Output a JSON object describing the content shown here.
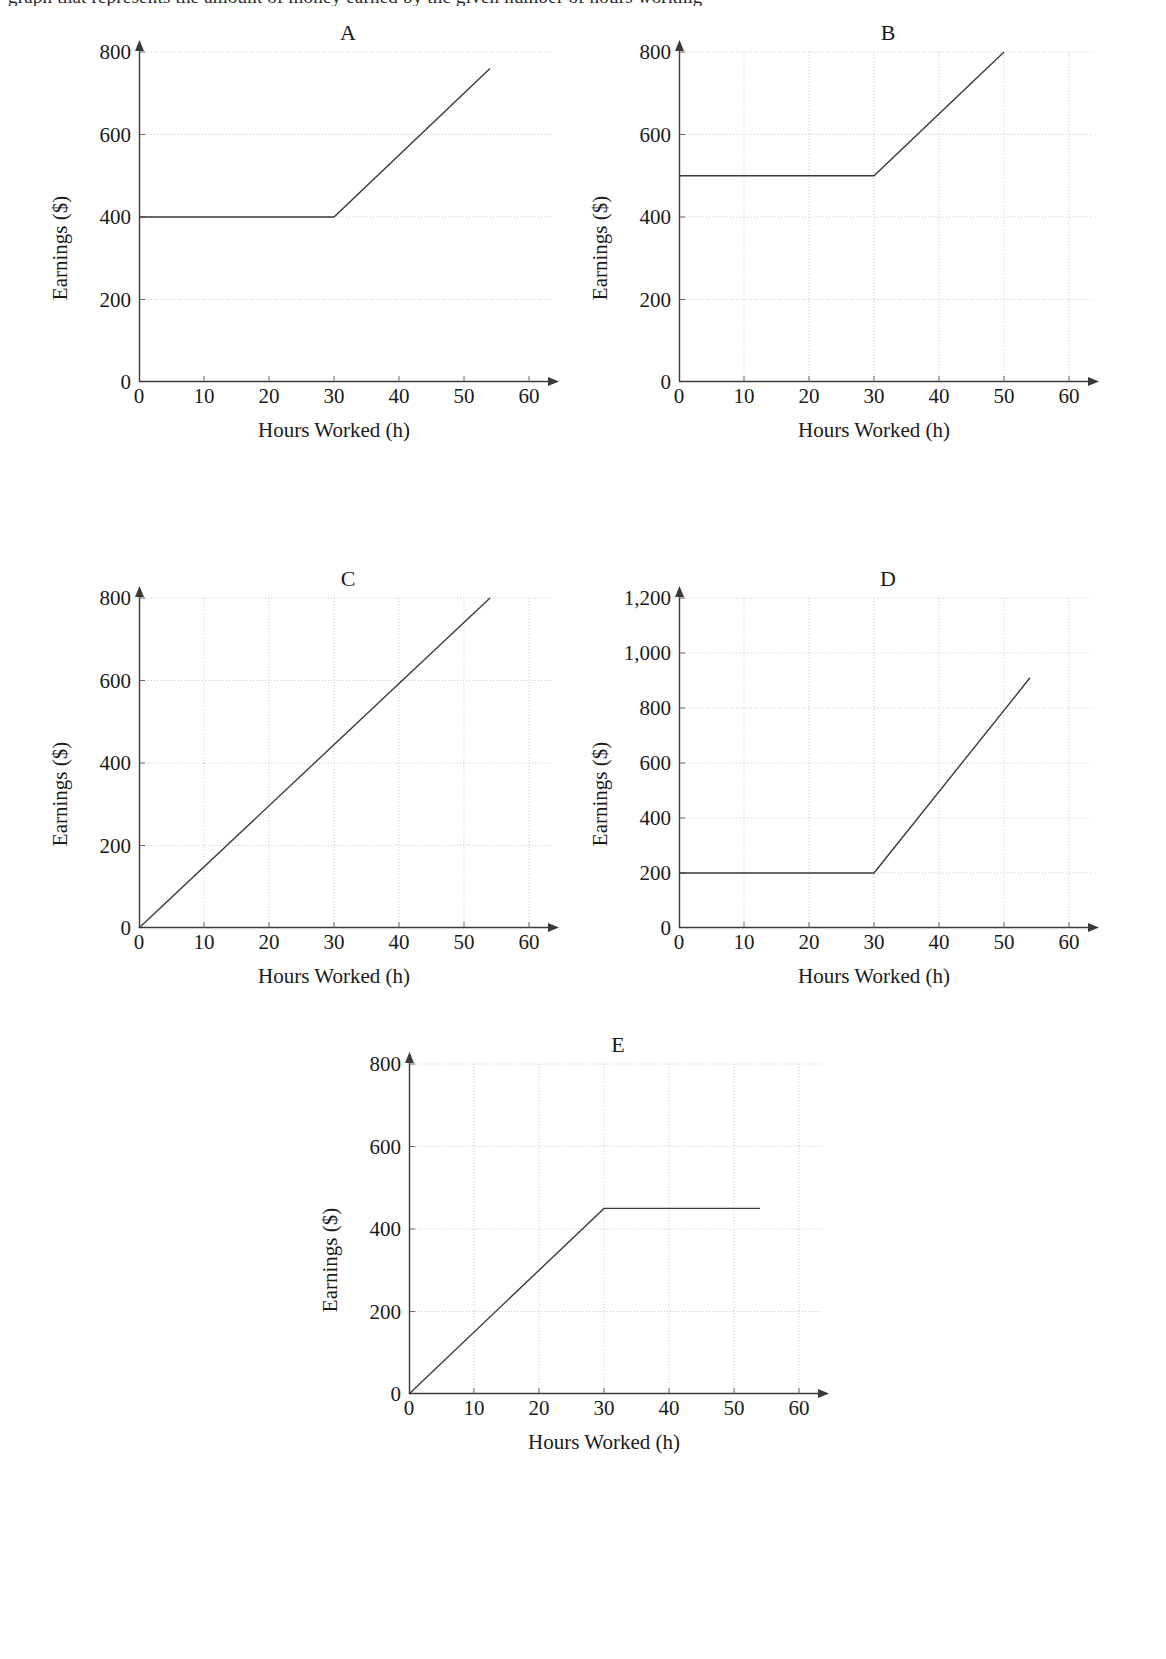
{
  "page": {
    "top_cut_text": "graph that represents the amount of money earned by the given number of hours working"
  },
  "shared": {
    "xlabel": "Hours Worked (h)",
    "ylabel": "Earnings ($)",
    "xticks": [
      "0",
      "10",
      "20",
      "30",
      "40",
      "50",
      "60"
    ],
    "xtick_values": [
      0,
      10,
      20,
      30,
      40,
      50,
      60
    ],
    "xlim": [
      0,
      60
    ]
  },
  "charts": [
    {
      "id": "A",
      "title": "A",
      "yticks": [
        "0",
        "200",
        "400",
        "600",
        "800"
      ],
      "ytick_values": [
        0,
        200,
        400,
        600,
        800
      ],
      "ylim": [
        0,
        800
      ],
      "show_vertical_grid": false,
      "points": [
        [
          0,
          400
        ],
        [
          30,
          400
        ],
        [
          54,
          760
        ]
      ]
    },
    {
      "id": "B",
      "title": "B",
      "yticks": [
        "0",
        "200",
        "400",
        "600",
        "800"
      ],
      "ytick_values": [
        0,
        200,
        400,
        600,
        800
      ],
      "ylim": [
        0,
        800
      ],
      "show_vertical_grid": true,
      "points": [
        [
          0,
          500
        ],
        [
          30,
          500
        ],
        [
          50,
          800
        ]
      ]
    },
    {
      "id": "C",
      "title": "C",
      "yticks": [
        "0",
        "200",
        "400",
        "600",
        "800"
      ],
      "ytick_values": [
        0,
        200,
        400,
        600,
        800
      ],
      "ylim": [
        0,
        800
      ],
      "show_vertical_grid": true,
      "points": [
        [
          0,
          0
        ],
        [
          54,
          800
        ]
      ]
    },
    {
      "id": "D",
      "title": "D",
      "yticks": [
        "0",
        "200",
        "400",
        "600",
        "800",
        "1,000",
        "1,200"
      ],
      "ytick_values": [
        0,
        200,
        400,
        600,
        800,
        1000,
        1200
      ],
      "ylim": [
        0,
        1200
      ],
      "show_vertical_grid": true,
      "points": [
        [
          0,
          200
        ],
        [
          30,
          200
        ],
        [
          54,
          910
        ]
      ]
    },
    {
      "id": "E",
      "title": "E",
      "yticks": [
        "0",
        "200",
        "400",
        "600",
        "800"
      ],
      "ytick_values": [
        0,
        200,
        400,
        600,
        800
      ],
      "ylim": [
        0,
        800
      ],
      "show_vertical_grid": true,
      "points": [
        [
          0,
          0
        ],
        [
          30,
          450
        ],
        [
          54,
          450
        ]
      ]
    }
  ],
  "chart_data": [
    {
      "type": "line",
      "title": "A",
      "xlabel": "Hours Worked (h)",
      "ylabel": "Earnings ($)",
      "xlim": [
        0,
        60
      ],
      "ylim": [
        0,
        800
      ],
      "xticks": [
        0,
        10,
        20,
        30,
        40,
        50,
        60
      ],
      "yticks": [
        0,
        200,
        400,
        600,
        800
      ],
      "grid": "horizontal dotted gridlines at y = 200, 400, 600, 800",
      "legend": "none",
      "x": [
        0,
        30,
        54
      ],
      "values": [
        400,
        400,
        760
      ],
      "description": "Flat at $400 from 0 to 30 hours, then increases linearly to about $760 at 54 hours (slope ≈ $15/h)"
    },
    {
      "type": "line",
      "title": "B",
      "xlabel": "Hours Worked (h)",
      "ylabel": "Earnings ($)",
      "xlim": [
        0,
        60
      ],
      "ylim": [
        0,
        800
      ],
      "xticks": [
        0,
        10,
        20,
        30,
        40,
        50,
        60
      ],
      "yticks": [
        0,
        200,
        400,
        600,
        800
      ],
      "grid": "dotted gridlines both directions; vertical at x = 10, 20, 30, 40, 50",
      "legend": "none",
      "x": [
        0,
        30,
        50
      ],
      "values": [
        500,
        500,
        800
      ],
      "description": "Flat at $500 from 0 to 30 hours, then increases linearly to $800 at 50 hours (slope = $15/h)"
    },
    {
      "type": "line",
      "title": "C",
      "xlabel": "Hours Worked (h)",
      "ylabel": "Earnings ($)",
      "xlim": [
        0,
        60
      ],
      "ylim": [
        0,
        800
      ],
      "xticks": [
        0,
        10,
        20,
        30,
        40,
        50,
        60
      ],
      "yticks": [
        0,
        200,
        400,
        600,
        800
      ],
      "grid": "dotted gridlines both directions",
      "legend": "none",
      "x": [
        0,
        54
      ],
      "values": [
        0,
        800
      ],
      "description": "Straight line through the origin rising to about $800 at 54 hours (constant slope ≈ $14.8/h)"
    },
    {
      "type": "line",
      "title": "D",
      "xlabel": "Hours Worked (h)",
      "ylabel": "Earnings ($)",
      "xlim": [
        0,
        60
      ],
      "ylim": [
        0,
        1200
      ],
      "xticks": [
        0,
        10,
        20,
        30,
        40,
        50,
        60
      ],
      "yticks": [
        0,
        200,
        400,
        600,
        800,
        1000,
        1200
      ],
      "grid": "dotted gridlines both directions",
      "legend": "none",
      "x": [
        0,
        30,
        54
      ],
      "values": [
        200,
        200,
        910
      ],
      "description": "Flat at $200 from 0 to 30 hours, then increases linearly to about $910 at 54 hours (slope ≈ $29.6/h)"
    },
    {
      "type": "line",
      "title": "E",
      "xlabel": "Hours Worked (h)",
      "ylabel": "Earnings ($)",
      "xlim": [
        0,
        60
      ],
      "ylim": [
        0,
        800
      ],
      "xticks": [
        0,
        10,
        20,
        30,
        40,
        50,
        60
      ],
      "yticks": [
        0,
        200,
        400,
        600,
        800
      ],
      "grid": "dotted gridlines both directions",
      "legend": "none",
      "x": [
        0,
        30,
        54
      ],
      "values": [
        0,
        450,
        450
      ],
      "description": "Rises linearly from the origin to $450 at 30 hours (slope = $15/h), then flat at $450 out to 54 hours"
    }
  ]
}
